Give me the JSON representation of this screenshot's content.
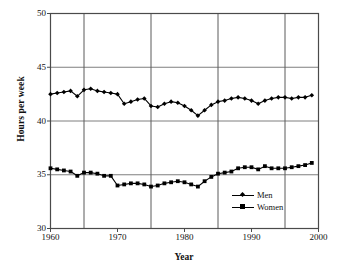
{
  "chart_data": {
    "type": "line",
    "title": "",
    "xlabel": "Year",
    "ylabel": "Hours per week",
    "xlim": [
      1960,
      2000
    ],
    "ylim": [
      30,
      50
    ],
    "grid": true,
    "grid_x_values": [
      1965,
      1975,
      1985,
      1995
    ],
    "grid_y_values": [
      35,
      40,
      45
    ],
    "xticks_major": [
      1960,
      1970,
      1980,
      1990,
      2000
    ],
    "xticks_minor": [
      1965,
      1975,
      1985,
      1995
    ],
    "xtick_labels": [
      "1960",
      "1970",
      "1980",
      "1990",
      "2000"
    ],
    "yticks": [
      30,
      35,
      40,
      45,
      50
    ],
    "ytick_labels": [
      "30",
      "35",
      "40",
      "45",
      "50"
    ],
    "legend_position": "lower right",
    "x": [
      1960,
      1961,
      1962,
      1963,
      1964,
      1965,
      1966,
      1967,
      1968,
      1969,
      1970,
      1971,
      1972,
      1973,
      1974,
      1975,
      1976,
      1977,
      1978,
      1979,
      1980,
      1981,
      1982,
      1983,
      1984,
      1985,
      1986,
      1987,
      1988,
      1989,
      1990,
      1991,
      1992,
      1993,
      1994,
      1995,
      1996,
      1997,
      1998,
      1999
    ],
    "series": [
      {
        "name": "Men",
        "marker": "diamond",
        "color": "#000000",
        "values": [
          42.5,
          42.6,
          42.7,
          42.8,
          42.3,
          42.9,
          43.0,
          42.8,
          42.7,
          42.6,
          42.5,
          41.6,
          41.8,
          42.0,
          42.1,
          41.4,
          41.3,
          41.6,
          41.8,
          41.7,
          41.4,
          41.0,
          40.5,
          41.0,
          41.5,
          41.8,
          41.9,
          42.1,
          42.2,
          42.1,
          41.9,
          41.6,
          41.9,
          42.1,
          42.2,
          42.2,
          42.1,
          42.2,
          42.2,
          42.4
        ]
      },
      {
        "name": "Women",
        "marker": "square",
        "color": "#000000",
        "values": [
          35.6,
          35.5,
          35.4,
          35.3,
          34.9,
          35.2,
          35.2,
          35.1,
          34.9,
          34.9,
          34.0,
          34.1,
          34.2,
          34.2,
          34.1,
          33.9,
          34.0,
          34.2,
          34.3,
          34.4,
          34.3,
          34.1,
          33.9,
          34.4,
          34.8,
          35.1,
          35.2,
          35.3,
          35.6,
          35.7,
          35.7,
          35.5,
          35.8,
          35.6,
          35.6,
          35.6,
          35.7,
          35.8,
          35.9,
          36.1
        ]
      }
    ]
  },
  "legend": {
    "items": [
      {
        "label": "Men"
      },
      {
        "label": "Women"
      }
    ]
  },
  "axes": {
    "ylabel": "Hours per week",
    "xlabel": "Year"
  }
}
